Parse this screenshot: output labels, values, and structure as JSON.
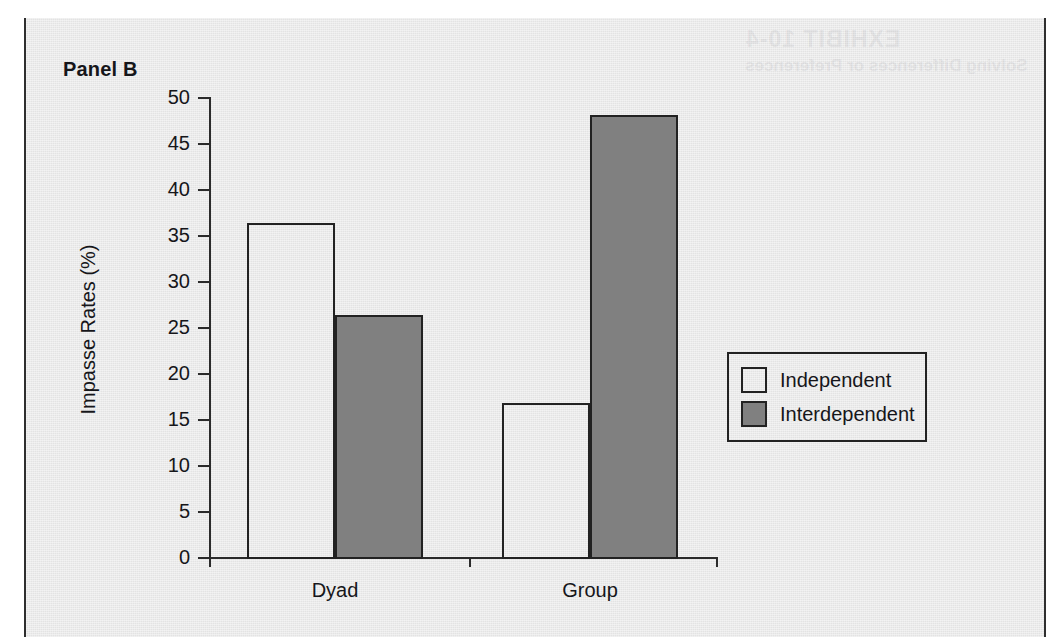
{
  "panel": {
    "label": "Panel B"
  },
  "bleed_through": {
    "title": "EXHIBIT 10-4",
    "subtitle": "Solving Differences or Preferences"
  },
  "colors": {
    "independent_fill": "#ffffff",
    "interdependent_fill": "#808080",
    "axis": "#2b2b2b",
    "text": "#16161a",
    "panel_background": "#e9e9e9",
    "panel_border": "#2e2e2e"
  },
  "chart_data": {
    "type": "bar",
    "title": "Panel B",
    "xlabel": "",
    "ylabel": "Impasse Rates (%)",
    "categories": [
      "Dyad",
      "Group"
    ],
    "series": [
      {
        "name": "Independent",
        "values": [
          36.3,
          16.7
        ]
      },
      {
        "name": "Interdependent",
        "values": [
          26.3,
          48.0
        ]
      }
    ],
    "ylim": [
      0,
      50
    ],
    "yticks": [
      0,
      5,
      10,
      15,
      20,
      25,
      30,
      35,
      40,
      45,
      50
    ],
    "ytick_labels": [
      "0",
      "5",
      "10",
      "15",
      "20",
      "25",
      "30",
      "35",
      "40",
      "45",
      "50"
    ],
    "grid": false,
    "legend_position": "right",
    "legend": [
      "Independent",
      "Interdependent"
    ]
  }
}
